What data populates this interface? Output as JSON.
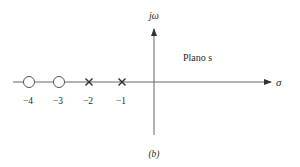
{
  "diagram": {
    "title": "Plano s",
    "caption": "(b)",
    "axes": {
      "vertical_label": "jω",
      "horizontal_label": "σ"
    },
    "zeros": [
      {
        "value": -4,
        "label": "−4"
      },
      {
        "value": -3,
        "label": "−3"
      }
    ],
    "poles": [
      {
        "value": -2,
        "label": "−2"
      },
      {
        "value": -1,
        "label": "−1"
      }
    ],
    "colors": {
      "stroke": "#555555",
      "text": "#2a2a2a"
    }
  }
}
